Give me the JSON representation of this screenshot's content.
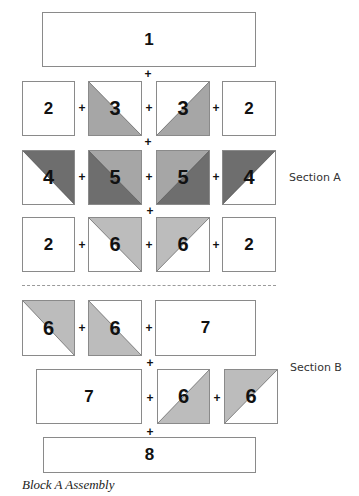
{
  "title": "Block A Assembly",
  "colors": {
    "light_gray": "#bcbcbc",
    "mid_gray": "#a6a6a6",
    "dark_gray": "#6e6e6e",
    "border": "#8a8a8a"
  },
  "sections": {
    "a_label": "Section A",
    "b_label": "Section B"
  },
  "plus_sign": "+",
  "blocks": {
    "b1": "1",
    "row2": [
      "2",
      "3",
      "3",
      "2"
    ],
    "row3": [
      "4",
      "5",
      "5",
      "4"
    ],
    "row4": [
      "2",
      "6",
      "6",
      "2"
    ],
    "row5": [
      "6",
      "6",
      "7"
    ],
    "row6": [
      "7",
      "6",
      "6"
    ],
    "b8": "8"
  }
}
